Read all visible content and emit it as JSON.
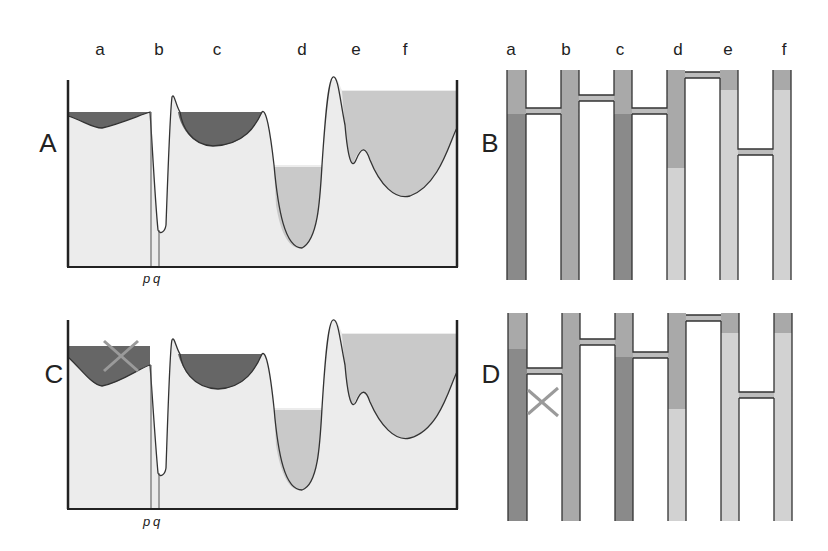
{
  "columns": [
    "a",
    "b",
    "c",
    "d",
    "e",
    "f"
  ],
  "panels": {
    "A": {
      "label": "A"
    },
    "B": {
      "label": "B"
    },
    "C": {
      "label": "C"
    },
    "D": {
      "label": "D"
    }
  },
  "markers": {
    "p": "p",
    "q": "q"
  },
  "colors": {
    "soil": "#ececec",
    "dark_fill": "#666666",
    "light_fill": "#c9c9c9",
    "tube_dark": "#8a8a8a",
    "tube_mid": "#a9a9a9",
    "tube_light": "#d2d2d2",
    "outline": "#333333",
    "cross": "#9a9a9a"
  }
}
